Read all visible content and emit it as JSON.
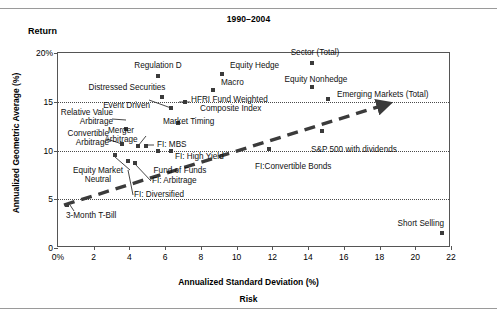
{
  "figure": {
    "title": "1990–2004",
    "return_label": "Return",
    "ylabel": "Annualized Geometric Average (%)",
    "xlabel": "Annualized Standard Deviation (%)",
    "risk_label": "Risk"
  },
  "chart_data": {
    "type": "scatter",
    "title": "1990–2004",
    "xlabel": "Annualized Standard Deviation (%)",
    "ylabel": "Annualized Geometric Average (%)",
    "xlim": [
      0,
      22
    ],
    "ylim": [
      0,
      20
    ],
    "xticks": [
      "0%",
      "2",
      "4",
      "6",
      "8",
      "10",
      "12",
      "14",
      "16",
      "18",
      "20",
      "22"
    ],
    "xtick_values": [
      0,
      2,
      4,
      6,
      8,
      10,
      12,
      14,
      16,
      18,
      20,
      22
    ],
    "yticks": [
      "0",
      "5",
      "10",
      "15",
      "20%"
    ],
    "ytick_values": [
      0,
      5,
      10,
      15,
      20
    ],
    "grid": "horizontal-dotted-at-5-10-15",
    "legend": "none",
    "annotation": "dashed arrow capital-market-line from 3-Month T-Bill rising to the right",
    "accent_color": "#3b3b3b",
    "points": [
      {
        "label": "Sector (Total)",
        "x": 14.2,
        "y": 19.0
      },
      {
        "label": "Regulation D",
        "x": 5.6,
        "y": 17.6
      },
      {
        "label": "Equity Hedge",
        "x": 9.2,
        "y": 17.8
      },
      {
        "label": "Equity Nonhedge",
        "x": 14.2,
        "y": 16.5
      },
      {
        "label": "Macro",
        "x": 8.7,
        "y": 16.2
      },
      {
        "label": "Emerging Markets (Total)",
        "x": 15.1,
        "y": 15.3
      },
      {
        "label": "Distressed Securities",
        "x": 5.8,
        "y": 15.5
      },
      {
        "label": "HFRI Fund Weighted Composite Index",
        "x": 7.1,
        "y": 15.0
      },
      {
        "label": "Event Driven",
        "x": 6.3,
        "y": 14.4
      },
      {
        "label": "Market Timing",
        "x": 6.7,
        "y": 12.8
      },
      {
        "label": "Relative Value Arbitrage",
        "x": 3.8,
        "y": 12.2
      },
      {
        "label": "Merger Arbitrage",
        "x": 4.5,
        "y": 10.5
      },
      {
        "label": "Convertible Arbitrage",
        "x": 3.6,
        "y": 10.7
      },
      {
        "label": "FI: MBS",
        "x": 4.9,
        "y": 10.5
      },
      {
        "label": "FI: High Yield",
        "x": 6.3,
        "y": 9.9
      },
      {
        "label": "Fund of Funds",
        "x": 5.6,
        "y": 10.0
      },
      {
        "label": "Equity Market Neutral",
        "x": 3.2,
        "y": 9.5
      },
      {
        "label": "FI: Diversified",
        "x": 3.9,
        "y": 8.9
      },
      {
        "label": "FI: Arbitrage",
        "x": 4.3,
        "y": 8.7
      },
      {
        "label": "FI:Convertible Bonds",
        "x": 11.8,
        "y": 10.2
      },
      {
        "label": "S&P 500 with dividends",
        "x": 14.8,
        "y": 12.0
      },
      {
        "label": "3-Month T-Bill",
        "x": 0.5,
        "y": 4.4
      },
      {
        "label": "Short Selling",
        "x": 21.5,
        "y": 1.5
      }
    ],
    "text_labels": [
      "Sector (Total)",
      "Regulation D",
      "Equity Hedge",
      "Equity Nonhedge",
      "Macro",
      "Emerging Markets (Total)",
      "Distressed Securities",
      "HFRI Fund Weighted Composite Index",
      "Event Driven",
      "Market Timing",
      "Relative Value Arbitrage",
      "Merger Arbitrage",
      "Convertible Arbitrage",
      "FI: MBS",
      "FI: High Yield",
      "Fund of Funds",
      "Equity Market Neutral",
      "FI: Diversified",
      "FI: Arbitrage",
      "FI:Convertible Bonds",
      "S&P 500 with dividends",
      "3-Month T-Bill",
      "Short Selling"
    ]
  },
  "labels": {
    "sector_total": "Sector (Total)",
    "regulation_d": "Regulation D",
    "equity_hedge": "Equity Hedge",
    "equity_nonhedge": "Equity Nonhedge",
    "macro": "Macro",
    "emerging_markets": "Emerging Markets (Total)",
    "distressed_securities": "Distressed Securities",
    "hfri_line1": "HFRI Fund Weighted",
    "hfri_line2": "Composite Index",
    "event_driven": "Event Driven",
    "market_timing": "Market Timing",
    "relative_value_1": "Relative Value",
    "relative_value_2": "Arbitrage",
    "merger_1": "Merger",
    "merger_2": "Arbitrage",
    "convertible_1": "Convertible",
    "convertible_2": "Arbitrage",
    "fi_mbs": "FI: MBS",
    "fi_high_yield": "FI: High Yield",
    "fund_of_funds": "Fund of Funds",
    "emn_1": "Equity Market",
    "emn_2": "Neutral",
    "fi_diversified": "FI: Diversified",
    "fi_arbitrage": "FI: Arbitrage",
    "fi_convertible_bonds": "FI:Convertible Bonds",
    "sp500": "S&P 500 with dividends",
    "tbill": "3-Month T-Bill",
    "short_selling": "Short Selling"
  },
  "axis": {
    "y": [
      {
        "text": "20%",
        "v": 20
      },
      {
        "text": "15",
        "v": 15
      },
      {
        "text": "10",
        "v": 10
      },
      {
        "text": "5",
        "v": 5
      },
      {
        "text": "0",
        "v": 0
      }
    ],
    "x": [
      {
        "text": "0%",
        "v": 0
      },
      {
        "text": "2",
        "v": 2
      },
      {
        "text": "4",
        "v": 4
      },
      {
        "text": "6",
        "v": 6
      },
      {
        "text": "8",
        "v": 8
      },
      {
        "text": "10",
        "v": 10
      },
      {
        "text": "12",
        "v": 12
      },
      {
        "text": "14",
        "v": 14
      },
      {
        "text": "16",
        "v": 16
      },
      {
        "text": "18",
        "v": 18
      },
      {
        "text": "20",
        "v": 20
      },
      {
        "text": "22",
        "v": 22
      }
    ]
  }
}
